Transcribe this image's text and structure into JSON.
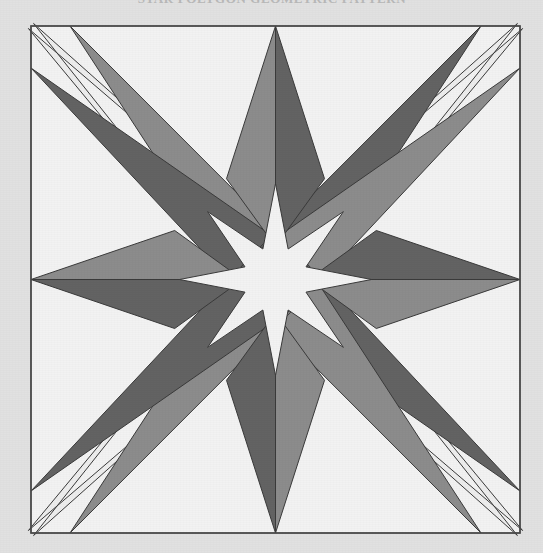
{
  "document": {
    "kind": "geometric-figure",
    "caption": "STAR POLYGON GEOMETRIC PATTERN",
    "background_color": "#e1e1e1"
  },
  "figure": {
    "name": "sixteen-point-star-compass-rose",
    "frame": {
      "left": 31,
      "top": 26,
      "right": 520,
      "bottom": 533,
      "fill": "#f2f2f2",
      "stroke": "#555555",
      "stroke_width": 1.4
    },
    "center": {
      "x": 275.5,
      "y": 279.5
    },
    "palette": {
      "white": "#f2f2f2",
      "light": "#ededed",
      "medium_gray": "#8c8c8c",
      "dark_gray": "#636363",
      "outline": "#3a3a3a",
      "background": "#e1e1e1"
    },
    "symmetry": "4-fold rotational",
    "point_count": 16,
    "tips": {
      "cardinal": [
        {
          "name": "north",
          "x": 275.5,
          "y": 26
        },
        {
          "name": "east",
          "x": 520,
          "y": 279.5
        },
        {
          "name": "south",
          "x": 275.5,
          "y": 533
        },
        {
          "name": "west",
          "x": 31,
          "y": 279.5
        }
      ],
      "ordinal": [
        {
          "name": "northwest",
          "x": 31,
          "y": 26
        },
        {
          "name": "northeast",
          "x": 520,
          "y": 26
        },
        {
          "name": "southeast",
          "x": 520,
          "y": 533
        },
        {
          "name": "southwest",
          "x": 31,
          "y": 533
        }
      ],
      "secondary": [
        {
          "name": "north-northwest",
          "x": 70,
          "y": 26
        },
        {
          "name": "west-northwest",
          "x": 31,
          "y": 68
        },
        {
          "name": "north-northeast",
          "x": 481,
          "y": 26
        },
        {
          "name": "east-northeast",
          "x": 520,
          "y": 68
        },
        {
          "name": "south-southeast",
          "x": 481,
          "y": 533
        },
        {
          "name": "east-southeast",
          "x": 520,
          "y": 491
        },
        {
          "name": "south-southwest",
          "x": 70,
          "y": 533
        },
        {
          "name": "west-southwest",
          "x": 31,
          "y": 491
        }
      ]
    },
    "inner_star": {
      "description": "light eight-pointed star at the centre formed by the overlapping pale arms",
      "inner_radius": 33,
      "outer_radius": 96
    }
  }
}
